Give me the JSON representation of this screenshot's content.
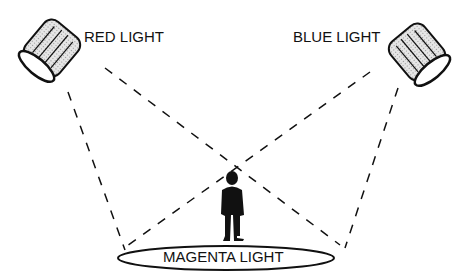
{
  "diagram": {
    "labels": {
      "red": "RED LIGHT",
      "blue": "BLUE LIGHT",
      "magenta": "MAGENTA LIGHT"
    },
    "elements": [
      "red-spotlight",
      "blue-spotlight",
      "person-silhouette",
      "stage-ellipse",
      "light-beams"
    ],
    "colors": {
      "stroke": "#111111",
      "fill": "#d8d8d8",
      "background": "#ffffff"
    }
  }
}
